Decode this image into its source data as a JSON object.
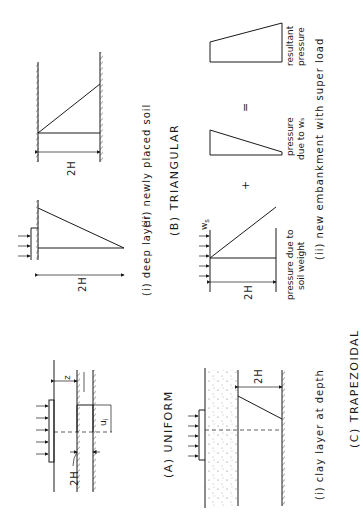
{
  "figure": {
    "orientation": "rotated 90 degrees counter-clockwise",
    "sections": [
      {
        "id": "A",
        "caption": "(A)  UNIFORM",
        "subfigures": [
          {
            "label": "(i)  clay layer at depth",
            "dimensions": [
              "2H",
              "z",
              "uᵢ"
            ]
          }
        ]
      },
      {
        "id": "B",
        "caption": "(B)   TRIANGULAR",
        "subfigures": [
          {
            "label": "(i)  deep layer",
            "dimensions": [
              "2H"
            ]
          },
          {
            "label": "(ii)  newly placed soil",
            "dimensions": [
              "2H"
            ]
          }
        ]
      },
      {
        "id": "C",
        "caption": "(C)   TRAPEZOIDAL",
        "subfigures": [
          {
            "label": "(i)  clay layer at depth",
            "dimensions": [
              "2H"
            ]
          },
          {
            "label": "(ii)  new embankment with super load",
            "dimensions": [
              "2H",
              "wₛ"
            ]
          }
        ]
      }
    ],
    "texts": {
      "a_caption": "(A)  UNIFORM",
      "a_2h": "2H",
      "a_z": "z",
      "a_ui": "u",
      "a_ui_sub": "i",
      "b_caption": "(B)   TRIANGULAR",
      "b_i_label": "(i)  deep layer",
      "b_i_2h": "2H",
      "b_ii_label": "(ii)  newly placed soil",
      "b_ii_2h": "2H",
      "c_caption": "(C)   TRAPEZOIDAL",
      "c_i_label": "(i)  clay layer at depth",
      "c_i_2h": "2H",
      "c_ii_label": "(ii)  new embankment with super load",
      "c_ii_2h": "2H",
      "c_ii_ws": "w",
      "c_ii_ws_sub": "s",
      "c_ii_plus": "+",
      "c_ii_equals": "=",
      "c_ii_soil_1": "pressure due to",
      "c_ii_soil_2": "soil weight",
      "c_ii_ws_1": "pressure",
      "c_ii_ws_2": "due to wₛ",
      "c_ii_res_1": "resultant",
      "c_ii_res_2": "pressure"
    }
  }
}
